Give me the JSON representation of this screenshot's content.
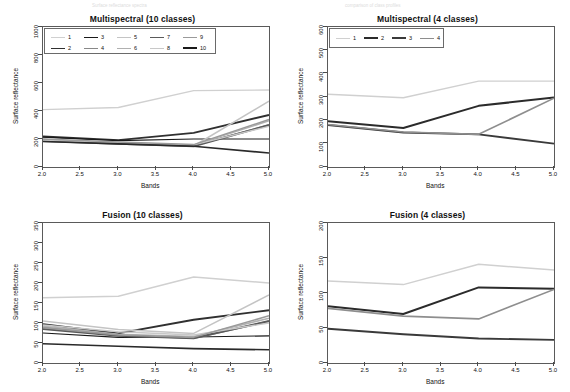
{
  "figure": {
    "ghost_text_left": "Surface reflectance spectra",
    "ghost_text_right": "comparison of class profiles"
  },
  "axis": {
    "xlabel": "Bands",
    "ylabel": "Surface reflectance",
    "xticks": [
      "2.0",
      "2.5",
      "3.0",
      "3.5",
      "4.0",
      "4.5",
      "5.0"
    ],
    "x": [
      2.0,
      3.0,
      4.0,
      5.0
    ],
    "xlim": [
      2.0,
      5.0
    ]
  },
  "chart_data": [
    {
      "id": "multispectral-10",
      "type": "line",
      "title": "Multispectral (10 classes)",
      "xlabel": "Bands",
      "ylabel": "Surface reflectance",
      "x": [
        2.0,
        3.0,
        4.0,
        5.0
      ],
      "xlim": [
        2.0,
        5.0
      ],
      "ylim": [
        0,
        1000
      ],
      "yticks": [
        "0",
        "200",
        "400",
        "600",
        "800",
        "1000"
      ],
      "grid": false,
      "legend_position": "top-left-inside",
      "series": [
        {
          "name": "1",
          "values": [
            410,
            425,
            545,
            550
          ],
          "color": "#d0d0d0",
          "width": 1.3
        },
        {
          "name": "2",
          "values": [
            218,
            192,
            244,
            372
          ],
          "color": "#303030",
          "width": 1.9
        },
        {
          "name": "3",
          "values": [
            213,
            188,
            200,
            200
          ],
          "color": "#1a1a1a",
          "width": 1.2
        },
        {
          "name": "4",
          "values": [
            196,
            170,
            152,
            300
          ],
          "color": "#888888",
          "width": 1.8
        },
        {
          "name": "5",
          "values": [
            188,
            168,
            150,
            470
          ],
          "color": "#c4c4c4",
          "width": 1.5
        },
        {
          "name": "6",
          "values": [
            192,
            172,
            156,
            330
          ],
          "color": "#b0b0b0",
          "width": 1.5
        },
        {
          "name": "7",
          "values": [
            185,
            166,
            148,
            300
          ],
          "color": "#5a5a5a",
          "width": 1.9
        },
        {
          "name": "8",
          "values": [
            190,
            175,
            158,
            290
          ],
          "color": "#c8c8c8",
          "width": 1.4
        },
        {
          "name": "9",
          "values": [
            200,
            178,
            160,
            340
          ],
          "color": "#9a9a9a",
          "width": 1.5
        },
        {
          "name": "10",
          "values": [
            182,
            165,
            148,
            100
          ],
          "color": "#2a2a2a",
          "width": 1.6
        }
      ]
    },
    {
      "id": "multispectral-4",
      "type": "line",
      "title": "Multispectral (4 classes)",
      "xlabel": "Bands",
      "ylabel": "Surface reflectance",
      "x": [
        2.0,
        3.0,
        4.0,
        5.0
      ],
      "xlim": [
        2.0,
        5.0
      ],
      "ylim": [
        0,
        600
      ],
      "yticks": [
        "0",
        "100",
        "200",
        "300",
        "400",
        "500",
        "600"
      ],
      "grid": false,
      "legend_position": "top-left-inside",
      "series": [
        {
          "name": "1",
          "values": [
            312,
            297,
            368,
            368
          ],
          "color": "#d0d0d0",
          "width": 1.4
        },
        {
          "name": "2",
          "values": [
            196,
            167,
            262,
            298
          ],
          "color": "#2b2b2b",
          "width": 2.0
        },
        {
          "name": "3",
          "values": [
            180,
            148,
            140,
            100
          ],
          "color": "#3a3a3a",
          "width": 1.9
        },
        {
          "name": "4",
          "values": [
            182,
            150,
            140,
            295
          ],
          "color": "#8e8e8e",
          "width": 1.6
        }
      ]
    },
    {
      "id": "fusion-10",
      "type": "line",
      "title": "Fusion (10 classes)",
      "xlabel": "Bands",
      "ylabel": "Surface reflectance",
      "x": [
        2.0,
        3.0,
        4.0,
        5.0
      ],
      "xlim": [
        2.0,
        5.0
      ],
      "ylim": [
        0,
        350
      ],
      "yticks": [
        "0",
        "50",
        "100",
        "150",
        "200",
        "250",
        "300",
        "350"
      ],
      "grid": false,
      "legend_position": "none",
      "series": [
        {
          "name": "1",
          "values": [
            163,
            167,
            215,
            200
          ],
          "color": "#d0d0d0",
          "width": 1.4
        },
        {
          "name": "2",
          "values": [
            97,
            74,
            108,
            132
          ],
          "color": "#303030",
          "width": 1.9
        },
        {
          "name": "3",
          "values": [
            75,
            64,
            65,
            68
          ],
          "color": "#1a1a1a",
          "width": 1.2
        },
        {
          "name": "4",
          "values": [
            90,
            70,
            62,
            104
          ],
          "color": "#888888",
          "width": 1.8
        },
        {
          "name": "5",
          "values": [
            105,
            84,
            74,
            170
          ],
          "color": "#c4c4c4",
          "width": 1.5
        },
        {
          "name": "6",
          "values": [
            92,
            72,
            66,
            112
          ],
          "color": "#b0b0b0",
          "width": 1.5
        },
        {
          "name": "7",
          "values": [
            85,
            68,
            62,
            105
          ],
          "color": "#5a5a5a",
          "width": 1.9
        },
        {
          "name": "8",
          "values": [
            95,
            78,
            70,
            100
          ],
          "color": "#c8c8c8",
          "width": 1.4
        },
        {
          "name": "9",
          "values": [
            88,
            70,
            64,
            118
          ],
          "color": "#9a9a9a",
          "width": 1.5
        },
        {
          "name": "10",
          "values": [
            48,
            42,
            36,
            33
          ],
          "color": "#2a2a2a",
          "width": 1.6
        }
      ]
    },
    {
      "id": "fusion-4",
      "type": "line",
      "title": "Fusion (4 classes)",
      "xlabel": "Bands",
      "ylabel": "Surface reflectance",
      "x": [
        2.0,
        3.0,
        4.0,
        5.0
      ],
      "xlim": [
        2.0,
        5.0
      ],
      "ylim": [
        0,
        200
      ],
      "yticks": [
        "0",
        "50",
        "100",
        "150",
        "200"
      ],
      "grid": false,
      "legend_position": "none",
      "series": [
        {
          "name": "1",
          "values": [
            117,
            112,
            141,
            133
          ],
          "color": "#d0d0d0",
          "width": 1.5
        },
        {
          "name": "2",
          "values": [
            81,
            70,
            108,
            106
          ],
          "color": "#2b2b2b",
          "width": 2.0
        },
        {
          "name": "3",
          "values": [
            49,
            41,
            35,
            33
          ],
          "color": "#3a3a3a",
          "width": 1.9
        },
        {
          "name": "4",
          "values": [
            78,
            67,
            63,
            105
          ],
          "color": "#8e8e8e",
          "width": 1.6
        }
      ]
    }
  ],
  "legends": {
    "ten_classes": {
      "entries": [
        {
          "label": "1",
          "color": "#d0d0d0",
          "width": 1.3
        },
        {
          "label": "2",
          "color": "#303030",
          "width": 1.9
        },
        {
          "label": "3",
          "color": "#1a1a1a",
          "width": 1.8
        },
        {
          "label": "4",
          "color": "#888888",
          "width": 1.6
        },
        {
          "label": "5",
          "color": "#c4c4c4",
          "width": 1.3
        },
        {
          "label": "6",
          "color": "#b0b0b0",
          "width": 1.3
        },
        {
          "label": "7",
          "color": "#5a5a5a",
          "width": 1.9
        },
        {
          "label": "8",
          "color": "#c8c8c8",
          "width": 1.3
        },
        {
          "label": "9",
          "color": "#9a9a9a",
          "width": 1.3
        },
        {
          "label": "10",
          "color": "#1a1a1a",
          "width": 2.0
        }
      ]
    },
    "four_classes": {
      "entries": [
        {
          "label": "1",
          "color": "#d0d0d0",
          "width": 1.4
        },
        {
          "label": "2",
          "color": "#2b2b2b",
          "width": 2.0
        },
        {
          "label": "3",
          "color": "#3a3a3a",
          "width": 2.0
        },
        {
          "label": "4",
          "color": "#8e8e8e",
          "width": 1.5
        }
      ]
    }
  }
}
